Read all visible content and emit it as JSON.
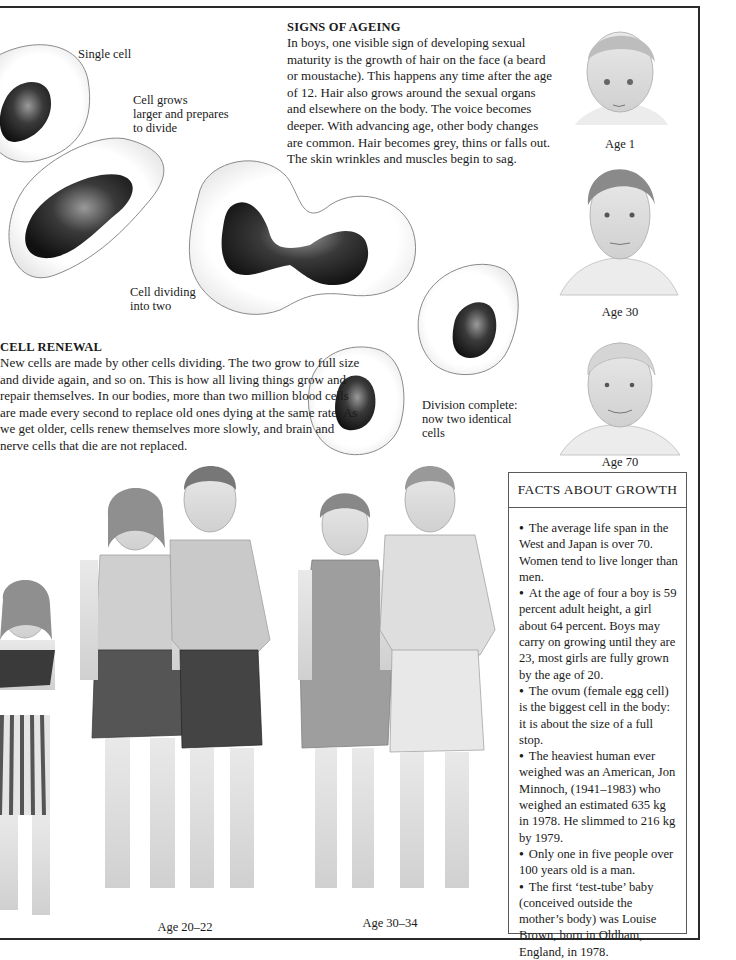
{
  "page": {
    "signs_of_ageing": {
      "heading": "SIGNS OF AGEING",
      "body": "In boys, one visible sign of developing sexual maturity is the growth of hair on the face (a beard or moustache). This happens any time after the age of 12. Hair also grows around the sexual organs and elsewhere on the body. The voice becomes deeper. With advancing age, other body changes are common. Hair becomes grey, thins or falls out. The skin wrinkles and muscles begin to sag."
    },
    "cell_renewal": {
      "heading": "CELL RENEWAL",
      "body": "New cells are made by other cells dividing. The two grow to full size and divide again, and so on. This is how all living things grow and repair themselves. In our bodies, more than two million blood cells are made every second to replace old ones dying at the same rate. As we get older, cells renew themselves more slowly, and brain and nerve cells that die are not replaced."
    },
    "cell_captions": {
      "single": "Single cell",
      "grows_line1": "Cell grows",
      "grows_line2": "larger and prepares",
      "grows_line3": "to divide",
      "dividing_line1": "Cell dividing",
      "dividing_line2": "into two",
      "complete_line1": "Division complete:",
      "complete_line2": "now two identical",
      "complete_line3": "cells"
    },
    "portraits": [
      {
        "label": "Age 1"
      },
      {
        "label": "Age 30"
      },
      {
        "label": "Age 70"
      }
    ],
    "figure_groups": [
      {
        "label": "Age 20–22"
      },
      {
        "label": "Age 30–34"
      }
    ],
    "facts_about_growth": {
      "heading": "FACTS ABOUT GROWTH",
      "items": [
        "The average life span in the West and Japan is over 70. Women tend to live longer than men.",
        "At the age of four a boy is 59 percent adult height, a girl about 64 percent. Boys may carry on growing until they are 23, most girls are fully grown by the age of 20.",
        "The ovum (female egg cell) is the biggest cell in the body: it is about the size of a full stop.",
        "The heaviest human ever weighed was an American, Jon Minnoch, (1941–1983) who weighed an estimated 635 kg in 1978. He slimmed to 216 kg by 1979.",
        "Only one in five people over 100 years old is a man.",
        "The first ‘test-tube’ baby (conceived outside the mother’s body) was Louise Brown, born in Oldham, England, in 1978."
      ]
    }
  }
}
